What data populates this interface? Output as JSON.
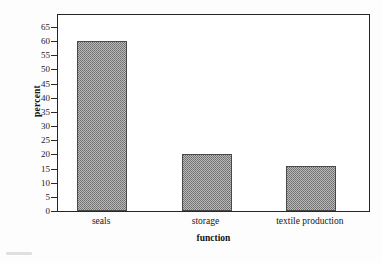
{
  "chart_data": {
    "type": "bar",
    "title": "",
    "categories": [
      "seals",
      "storage",
      "textile production"
    ],
    "values": [
      60,
      20,
      16
    ],
    "xlabel": "function",
    "ylabel": "percent",
    "ylim": [
      0,
      65
    ],
    "ytick_step": 5,
    "yticks": [
      0,
      5,
      10,
      15,
      20,
      25,
      30,
      35,
      40,
      45,
      50,
      55,
      60,
      65
    ],
    "ytick_labels": [
      "0",
      "5",
      "10",
      "15",
      "20",
      "25",
      "30",
      "35",
      "40",
      "45",
      "50",
      "55",
      "60",
      "65"
    ],
    "grid": false,
    "legend": null,
    "legend_position": "none",
    "bar_fill": "#b9b9b9",
    "bar_edge": "#4a4a4a",
    "axis_color": "#262626",
    "background": "#ffffff",
    "series": [
      {
        "name": "percent",
        "values": [
          60,
          20,
          16
        ]
      }
    ],
    "annotations": []
  }
}
